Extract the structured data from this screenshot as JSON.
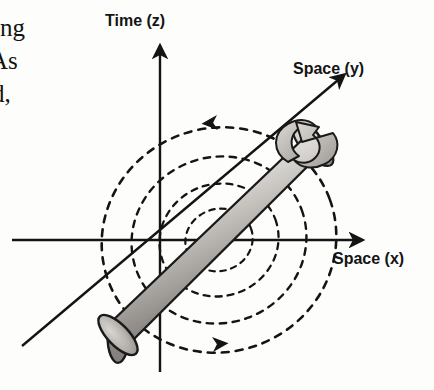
{
  "page": {
    "background_color": "#fdfdfc",
    "ink_color": "#141414"
  },
  "body_text": {
    "line_1": "ting",
    "line_2": "As",
    "line_3": "d,"
  },
  "figure": {
    "type": "scientific-diagram",
    "axes": [
      {
        "id": "z",
        "label": "Time (z)",
        "direction": "vertical-up"
      },
      {
        "id": "y",
        "label": "Space (y)",
        "direction": "diagonal-up-right"
      },
      {
        "id": "x",
        "label": "Space (x)",
        "direction": "horizontal-right"
      }
    ],
    "labels": {
      "time_z": "Time (z)",
      "space_y": "Space (y)",
      "space_x": "Space (x)"
    },
    "cylinder": {
      "name": "rotating-cylinder",
      "orientation": "along-y-axis",
      "fill_light": "#f2f0ee",
      "fill_mid": "#b9b6b2",
      "fill_dark": "#6e6b67",
      "outline": "#1a1a1a"
    },
    "rotation_rings": {
      "name": "dashed-frame-dragging-rings",
      "count": 4,
      "style": "dashed",
      "color": "#141414",
      "arrow_directions": [
        "left-at-top",
        "right-at-bottom"
      ]
    },
    "spin_arrow": {
      "name": "cylinder-spin-arrow",
      "style": "curved-ribbon",
      "color": "#1a1a1a"
    }
  }
}
